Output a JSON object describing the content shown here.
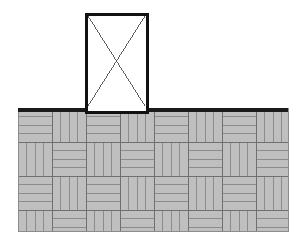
{
  "figure": {
    "canvas": {
      "width": 302,
      "height": 245,
      "background": "#ffffff"
    }
  },
  "colors": {
    "paving_fill": "#bfbfbf",
    "paving_joint_line": "#8c8c8c",
    "paving_block_outline": "#707070",
    "ground_line": "#1a1a1a",
    "footing_outline": "#111111",
    "footing_fill": "#ffffff",
    "footing_diagonal": "#4a4a4a"
  },
  "ground": {
    "name": "ground-surface-line",
    "x1": 18,
    "y1": 108,
    "x2": 288,
    "y2": 108,
    "thickness": 3.5
  },
  "paving": {
    "name": "basketweave-paving",
    "left": 18,
    "top": 108,
    "right": 288,
    "bottom": 231,
    "width": 270,
    "height": 123,
    "cell_size": 34,
    "slats_per_cell": 4,
    "pattern": "basketweave",
    "columns": 8,
    "rows": 4
  },
  "footing": {
    "name": "rectangular-footing",
    "left": 86,
    "top": 14,
    "right": 147,
    "bottom": 112,
    "width": 61,
    "height": 98,
    "stroke_width": 3,
    "diagonals": "X",
    "diagonal_stroke_width": 0.9,
    "embedment_below_ground": 4
  }
}
